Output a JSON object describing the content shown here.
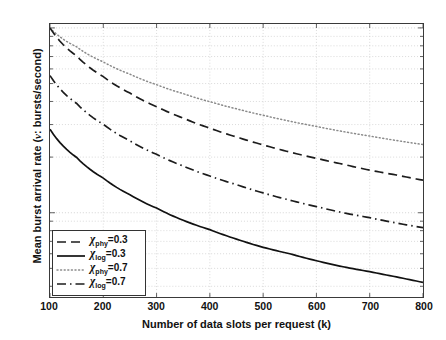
{
  "chart_data": {
    "type": "line",
    "title": "",
    "xlabel": "Number of data slots per request (k)",
    "ylabel": "Mean burst arrival rate (ν: bursts/second)",
    "ylabel_prefix": "Mean burst arrival rate (",
    "ylabel_symbol": "ν",
    "ylabel_suffix": ": bursts/second)",
    "xscale": "linear",
    "yscale": "log",
    "xlim": [
      100,
      800
    ],
    "ylim": [
      0.0035,
      0.105
    ],
    "grid": true,
    "grid_style": "dotted",
    "legend_position": "lower left",
    "xticks": [
      "100",
      "200",
      "300",
      "400",
      "500",
      "600",
      "700",
      "800"
    ],
    "xtick_values": [
      100,
      200,
      300,
      400,
      500,
      600,
      700,
      800
    ],
    "yticks": [
      "10",
      "10"
    ],
    "ytick_labels": [
      {
        "mantissa": "10",
        "exponent": "-1",
        "value": 0.1
      },
      {
        "mantissa": "10",
        "exponent": "-2",
        "value": 0.01
      }
    ],
    "x": [
      100,
      150,
      200,
      250,
      300,
      350,
      400,
      450,
      500,
      550,
      600,
      650,
      700,
      750,
      800
    ],
    "series": [
      {
        "name": "chi_phy_07",
        "legend_label_prefix": "χ",
        "legend_label_sub": "phy",
        "legend_label_suffix": "=0.7",
        "linestyle": "dotted",
        "color": "#8a8a8a",
        "values": [
          0.1,
          0.079,
          0.0655,
          0.0562,
          0.0493,
          0.0441,
          0.0399,
          0.0365,
          0.0337,
          0.0313,
          0.0293,
          0.0275,
          0.026,
          0.0246,
          0.0234
        ]
      },
      {
        "name": "chi_phy_03",
        "legend_label_prefix": "χ",
        "legend_label_sub": "phy",
        "legend_label_suffix": "=0.3",
        "linestyle": "dashed",
        "color": "#1c1c1c",
        "values": [
          0.1,
          0.0705,
          0.0545,
          0.0444,
          0.0375,
          0.0325,
          0.0287,
          0.0257,
          0.0233,
          0.0213,
          0.0197,
          0.0183,
          0.017,
          0.016,
          0.015
        ]
      },
      {
        "name": "chi_log_07",
        "legend_label_prefix": "χ",
        "legend_label_sub": "log",
        "legend_label_suffix": "=0.7",
        "linestyle": "dashdot",
        "color": "#1c1c1c",
        "values": [
          0.0552,
          0.039,
          0.0301,
          0.0245,
          0.0207,
          0.0179,
          0.0158,
          0.0142,
          0.0128,
          0.0117,
          0.0108,
          0.01,
          0.0094,
          0.0088,
          0.0083
        ]
      },
      {
        "name": "chi_log_03",
        "legend_label_prefix": "χ",
        "legend_label_sub": "log",
        "legend_label_suffix": "=0.3",
        "linestyle": "solid",
        "color": "#111111",
        "values": [
          0.0283,
          0.0199,
          0.0154,
          0.0125,
          0.0106,
          0.0091,
          0.0081,
          0.0072,
          0.0065,
          0.006,
          0.0055,
          0.0051,
          0.0048,
          0.0045,
          0.0042
        ]
      }
    ],
    "legend_order": [
      "chi_phy_03",
      "chi_log_03",
      "chi_phy_07",
      "chi_log_07"
    ]
  },
  "legend": {
    "entries": [
      {
        "prefix": "χ",
        "sub": "phy",
        "suffix": "=0.3",
        "style": "dashed"
      },
      {
        "prefix": "χ",
        "sub": "log",
        "suffix": "=0.3",
        "style": "solid"
      },
      {
        "prefix": "χ",
        "sub": "phy",
        "suffix": "=0.7",
        "style": "dotted"
      },
      {
        "prefix": "χ",
        "sub": "log",
        "suffix": "=0.7",
        "style": "dashdot"
      }
    ]
  },
  "colors": {
    "axis": "#3a3a3a",
    "grid": "#c9c9c9",
    "text": "#111111",
    "background": "#ffffff"
  }
}
